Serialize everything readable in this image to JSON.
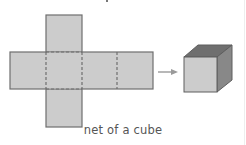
{
  "figure": {
    "caption": "net of a cube",
    "colors": {
      "face_fill": "#cccccc",
      "edge_stroke": "#6e6e6e",
      "fold_line": "#6e6e6e",
      "cube_front": "#cccccc",
      "cube_top": "#6f6f6f",
      "cube_side": "#888888",
      "arrow": "#9a9a9a",
      "caption_text": "#555555"
    },
    "net": {
      "description": "cross-shaped net of six squares with dashed fold lines",
      "faces": 6
    },
    "arrow": {
      "direction": "right"
    },
    "cube": {
      "description": "3D cube folded from net"
    }
  }
}
